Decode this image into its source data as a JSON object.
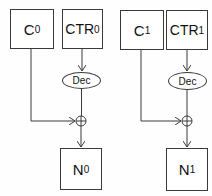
{
  "diagram": {
    "columns": [
      {
        "ciphertext": {
          "label": "C",
          "sub": "0"
        },
        "counter": {
          "label": "CTR",
          "sub": "0"
        },
        "decrypt": {
          "label": "Dec"
        },
        "xor": {
          "symbol": "xor"
        },
        "output": {
          "label": "N",
          "sub": "0"
        }
      },
      {
        "ciphertext": {
          "label": "C",
          "sub": "1"
        },
        "counter": {
          "label": "CTR",
          "sub": "1"
        },
        "decrypt": {
          "label": "Dec"
        },
        "xor": {
          "symbol": "xor"
        },
        "output": {
          "label": "N",
          "sub": "1"
        }
      }
    ],
    "colors": {
      "stroke": "#3a3a3a",
      "background": "#ffffff"
    }
  }
}
